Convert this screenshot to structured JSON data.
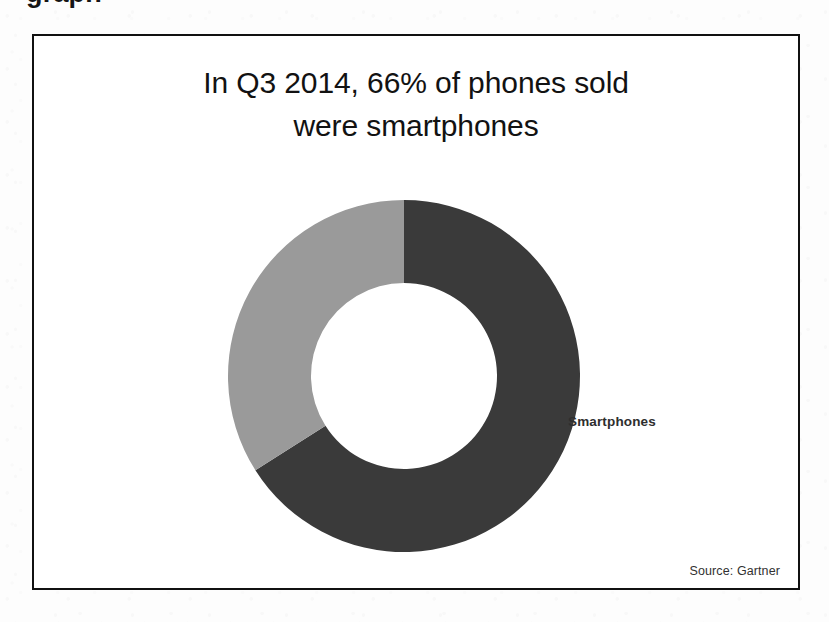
{
  "page": {
    "cutoff_heading_fragment": "graph",
    "background_color": "#fdfdfd"
  },
  "figure": {
    "border_color": "#111111",
    "background_color": "#ffffff",
    "title_line_1": "In Q3 2014, 66% of phones sold",
    "title_line_2": "were smartphones",
    "series_label": "Smartphones",
    "source_note": "Source: Gartner"
  },
  "chart_data": {
    "type": "pie",
    "variant": "donut",
    "title": "In Q3 2014, 66% of phones sold were smartphones",
    "labels": [
      "Smartphones",
      "Other phones"
    ],
    "values": [
      66,
      34
    ],
    "value_unit": "%",
    "colors": [
      "#3a3a3a",
      "#9a9a9a"
    ],
    "start_angle_deg": 0,
    "direction": "clockwise",
    "hole_ratio": 0.53,
    "legend_position": "none",
    "data_labels_shown": [
      "Smartphones"
    ],
    "grid": false,
    "annotations": [
      "Source: Gartner"
    ],
    "center_x": 402,
    "center_y": 373,
    "outer_radius": 176,
    "inner_radius": 93
  }
}
